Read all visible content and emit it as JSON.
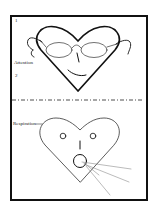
{
  "labels": {
    "step1": "1",
    "attention": "Attention",
    "step2": "2",
    "respiration": "Respiration"
  },
  "colors": {
    "ink": "#111111",
    "breath_lines": "#777777",
    "background": "#ffffff"
  },
  "figures": [
    {
      "name": "heart-face-with-glasses",
      "section": "attention"
    },
    {
      "name": "heart-face-breathing",
      "section": "respiration"
    }
  ]
}
